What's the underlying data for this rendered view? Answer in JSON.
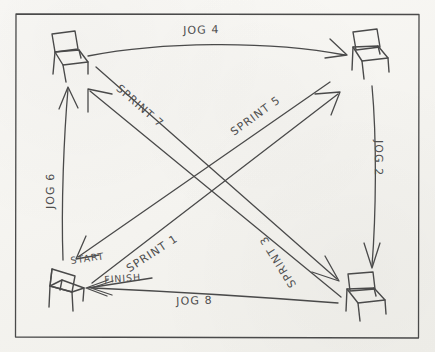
{
  "diagram": {
    "medium": "hand-drawn pencil on paper",
    "border": {
      "present": true,
      "color": "#555555"
    },
    "ink_color": "#4a4a4a",
    "paper_color": "#f7f6f3",
    "stations": [
      {
        "id": "chair-top-left",
        "label": "",
        "corner": "top-left"
      },
      {
        "id": "chair-top-right",
        "label": "",
        "corner": "top-right"
      },
      {
        "id": "chair-bottom-right",
        "label": "",
        "corner": "bottom-right"
      },
      {
        "id": "chair-bottom-left",
        "label": "",
        "corner": "bottom-left"
      }
    ],
    "markers": [
      {
        "id": "start-marker",
        "text": "START"
      },
      {
        "id": "finish-marker",
        "text": "FINISH"
      }
    ],
    "routes": [
      {
        "id": "jog-4",
        "text": "JOG 4",
        "from": "chair-top-left",
        "to": "chair-top-right",
        "kind": "jog",
        "number": 4,
        "orientation": "horizontal-top"
      },
      {
        "id": "jog-2",
        "text": "JOG 2",
        "from": "chair-top-right",
        "to": "chair-bottom-right",
        "kind": "jog",
        "number": 2,
        "orientation": "vertical-right"
      },
      {
        "id": "jog-8",
        "text": "JOG 8",
        "from": "chair-bottom-right",
        "to": "chair-bottom-left",
        "kind": "jog",
        "number": 8,
        "orientation": "horizontal-bottom"
      },
      {
        "id": "jog-6",
        "text": "JOG 6",
        "from": "chair-bottom-left",
        "to": "chair-top-left",
        "kind": "jog",
        "number": 6,
        "orientation": "vertical-left"
      },
      {
        "id": "sprint-1",
        "text": "SPRINT 1",
        "from": "chair-bottom-left",
        "to": "chair-top-right",
        "kind": "sprint",
        "number": 1,
        "orientation": "diagonal-up-right"
      },
      {
        "id": "sprint-3",
        "text": "SPRINT 3",
        "from": "chair-bottom-right",
        "to": "chair-top-left",
        "kind": "sprint",
        "number": 3,
        "orientation": "diagonal-up-left"
      },
      {
        "id": "sprint-5",
        "text": "SPRINT 5",
        "from": "chair-bottom-left",
        "to": "chair-top-right",
        "kind": "sprint",
        "number": 5,
        "orientation": "diagonal-up-right"
      },
      {
        "id": "sprint-7",
        "text": "SPRINT 7",
        "from": "chair-top-left",
        "to": "chair-bottom-right",
        "kind": "sprint",
        "number": 7,
        "orientation": "diagonal-down-right"
      }
    ]
  }
}
